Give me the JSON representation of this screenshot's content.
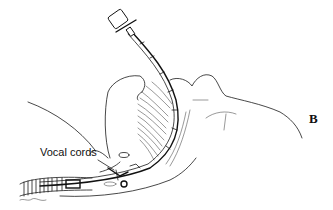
{
  "figure": {
    "panel_label": "B",
    "annotations": [
      {
        "label": "Vocal cords"
      }
    ],
    "colors": {
      "ink": "#1a1a1a",
      "background": "#ffffff"
    }
  }
}
